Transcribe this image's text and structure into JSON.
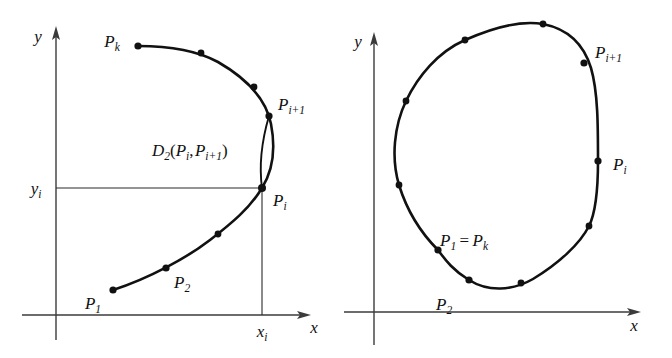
{
  "figure": {
    "background_color": "#ffffff",
    "stroke_color": "#111111",
    "axis_color": "#444444",
    "width": 672,
    "height": 358
  },
  "panels": [
    {
      "id": "left",
      "name": "open-curve-panel",
      "description": "Open curve with sample points, chord and arc between P_i and P_i+1, with coordinate projection lines",
      "axes": {
        "x_label": "x",
        "y_label": "y",
        "x_tick_label": "x",
        "x_tick_sub": "i",
        "y_tick_label": "y",
        "y_tick_sub": "i"
      },
      "labels": [
        {
          "name": "label-pk",
          "base": "P",
          "sub": "k",
          "x": 112,
          "y": 41,
          "anchor": "middle"
        },
        {
          "name": "label-pi1",
          "base": "P",
          "sub": "i+1",
          "x": 278,
          "y": 103,
          "anchor": "start"
        },
        {
          "name": "label-pi",
          "base": "P",
          "sub": "i",
          "x": 272,
          "y": 200,
          "anchor": "start"
        },
        {
          "name": "label-p1",
          "base": "P",
          "sub": "1",
          "x": 91,
          "y": 305,
          "anchor": "middle"
        },
        {
          "name": "label-p2",
          "base": "P",
          "sub": "2",
          "x": 172,
          "y": 283,
          "anchor": "start"
        }
      ],
      "distance_label": {
        "name": "distance-label",
        "text": "D2(Pi, Pi+1)",
        "parts": [
          {
            "base": "D",
            "sub": "2"
          },
          {
            "paren": "("
          },
          {
            "base": "P",
            "sub": "i"
          },
          {
            "comma": ","
          },
          {
            "base": "P",
            "sub": "i+1"
          },
          {
            "paren": ")"
          }
        ],
        "x": 152,
        "y": 150
      },
      "points": [
        {
          "name": "point-pk",
          "x": 138,
          "y": 46,
          "label": "P_k"
        },
        {
          "name": "point-a",
          "x": 201,
          "y": 53,
          "label": ""
        },
        {
          "name": "point-b",
          "x": 254,
          "y": 87,
          "label": ""
        },
        {
          "name": "point-pi1",
          "x": 269,
          "y": 116,
          "label": "P_i+1"
        },
        {
          "name": "point-pi",
          "x": 262,
          "y": 188,
          "label": "P_i"
        },
        {
          "name": "point-c",
          "x": 218,
          "y": 234,
          "label": ""
        },
        {
          "name": "point-p2",
          "x": 166,
          "y": 268,
          "label": "P_2"
        },
        {
          "name": "point-p1",
          "x": 113,
          "y": 290,
          "label": "P_1"
        }
      ]
    },
    {
      "id": "right",
      "name": "closed-curve-panel",
      "description": "Closed curve with sample points P_1 = P_k around the boundary",
      "axes": {
        "x_label": "x",
        "y_label": "y"
      },
      "labels": [
        {
          "name": "label-pi1",
          "base": "P",
          "sub": "i+1",
          "x": 259,
          "y": 51,
          "anchor": "start"
        },
        {
          "name": "label-pi",
          "base": "P",
          "sub": "i",
          "x": 275,
          "y": 164,
          "anchor": "start"
        },
        {
          "name": "label-p2",
          "base": "P",
          "sub": "2",
          "x": 100,
          "y": 306,
          "anchor": "start"
        }
      ],
      "closure_label": {
        "name": "closure-label",
        "text": "P1 = Pk",
        "parts": [
          {
            "base": "P",
            "sub": "1"
          },
          {
            "eq": "="
          },
          {
            "base": "P",
            "sub": "k"
          }
        ],
        "x": 104,
        "y": 240
      },
      "points": [
        {
          "name": "point-top-left",
          "x": 129,
          "y": 40,
          "label": ""
        },
        {
          "name": "point-top-right",
          "x": 207,
          "y": 24,
          "label": ""
        },
        {
          "name": "point-pi1",
          "x": 248,
          "y": 63,
          "label": "P_i+1"
        },
        {
          "name": "point-upper-left",
          "x": 70,
          "y": 101,
          "label": ""
        },
        {
          "name": "point-pi",
          "x": 262,
          "y": 161,
          "label": "P_i"
        },
        {
          "name": "point-mid-left",
          "x": 63,
          "y": 185,
          "label": ""
        },
        {
          "name": "point-lower-right",
          "x": 253,
          "y": 226,
          "label": ""
        },
        {
          "name": "point-p1pk",
          "x": 102,
          "y": 250,
          "label": "P_1 = P_k"
        },
        {
          "name": "point-p2",
          "x": 133,
          "y": 280,
          "label": "P_2"
        },
        {
          "name": "point-bottom-right",
          "x": 185,
          "y": 283,
          "label": ""
        }
      ]
    }
  ]
}
